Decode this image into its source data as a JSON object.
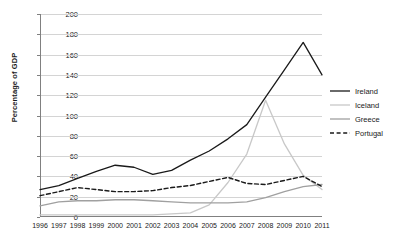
{
  "chart_data": {
    "type": "line",
    "title": "",
    "xlabel": "",
    "ylabel": "Percentage of GDP",
    "ylim": [
      0,
      200
    ],
    "ytick_step": 20,
    "grid": "horizontal",
    "legend_position": "right",
    "categories": [
      "1996",
      "1997",
      "1998",
      "1999",
      "2000",
      "2001",
      "2002",
      "2003",
      "2004",
      "2005",
      "2006",
      "2007",
      "2008",
      "2009",
      "2010",
      "2011"
    ],
    "yticks": [
      "0",
      "20",
      "40",
      "60",
      "80",
      "100",
      "120",
      "140",
      "160",
      "180",
      "200"
    ],
    "series": [
      {
        "name": "Ireland",
        "color": "#1a1a1a",
        "style": "solid",
        "values": [
          27,
          31,
          38,
          45,
          51,
          49,
          42,
          46,
          56,
          65,
          77,
          91,
          118,
          145,
          172,
          140
        ]
      },
      {
        "name": "Iceland",
        "color": "#c8c8c8",
        "style": "solid",
        "values": [
          2,
          2,
          2,
          2,
          2,
          2,
          2,
          3,
          4,
          12,
          34,
          62,
          115,
          72,
          41,
          27
        ]
      },
      {
        "name": "Greece",
        "color": "#a0a0a0",
        "style": "solid",
        "values": [
          11,
          15,
          16,
          16,
          17,
          17,
          16,
          15,
          14,
          14,
          14,
          15,
          19,
          25,
          30,
          32
        ]
      },
      {
        "name": "Portugal",
        "color": "#1a1a1a",
        "style": "dashed",
        "values": [
          21,
          25,
          29,
          27,
          25,
          25,
          26,
          29,
          31,
          35,
          39,
          33,
          32,
          36,
          40,
          30
        ]
      }
    ]
  },
  "legend": {
    "entries": [
      {
        "label": "Ireland"
      },
      {
        "label": "Iceland"
      },
      {
        "label": "Greece"
      },
      {
        "label": "Portugal"
      }
    ]
  }
}
